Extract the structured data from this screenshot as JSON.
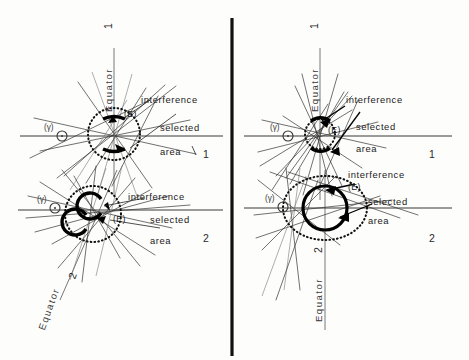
{
  "figure": {
    "background_color": "#fdfdfc",
    "ink_color": "#1a1a1a",
    "panel_count": 4,
    "divider": {
      "name": "vertical-divider",
      "x": 232,
      "y1": 18,
      "y2": 356
    }
  },
  "labels": {
    "equator": "Equator",
    "interference": "interference",
    "selected": "selected",
    "area": "area",
    "center_E": "(E)",
    "gamma": "(γ)",
    "one": "1",
    "two": "2"
  },
  "panels": [
    {
      "id": "top-left",
      "row_number": "1",
      "equator_label": "Equator",
      "equator_number": "1",
      "equator_orientation": "vertical",
      "center": {
        "x": 114,
        "y": 134
      },
      "center_label": "(E)",
      "gamma_label": "(γ)",
      "gamma_point": {
        "x": 62,
        "y": 136
      },
      "dotted_circle_radius": 26,
      "inner_mark": "two-horizontal-arcs",
      "callouts": [
        "interference",
        "selected",
        "area"
      ]
    },
    {
      "id": "bottom-left",
      "row_number": "2",
      "equator_label": "Equator",
      "equator_number": "2",
      "equator_orientation": "tilted",
      "center": {
        "x": 93,
        "y": 214
      },
      "center_label": "(E)",
      "gamma_label": "(γ)",
      "gamma_point": {
        "x": 55,
        "y": 208
      },
      "dotted_circle_radius": 28,
      "inner_mark": "two-c-arcs",
      "callouts": [
        "interference",
        "selected",
        "area"
      ]
    },
    {
      "id": "top-right",
      "row_number": "1",
      "equator_label": "Equator",
      "equator_number": "1",
      "equator_orientation": "vertical",
      "center": {
        "x": 320,
        "y": 134
      },
      "center_label": "(E)",
      "gamma_label": "(γ)",
      "gamma_point": {
        "x": 288,
        "y": 136
      },
      "dotted_circle_radius": 15,
      "inner_mark": "two-vertical-thick-arcs",
      "callouts": [
        "interference",
        "selected",
        "area"
      ]
    },
    {
      "id": "bottom-right",
      "row_number": "2",
      "equator_label": "Equator",
      "equator_number": "2",
      "equator_orientation": "vertical",
      "center": {
        "x": 325,
        "y": 208
      },
      "center_label": "(E)",
      "gamma_label": "(γ)",
      "gamma_point": {
        "x": 283,
        "y": 207
      },
      "dotted_circle_radius": 38,
      "inner_circle_radius": 22,
      "inner_mark": "solid-circle",
      "callouts": [
        "interference",
        "selected",
        "area"
      ]
    }
  ],
  "margin_numbers": [
    {
      "text": "1",
      "x": 431,
      "y": 155
    },
    {
      "text": "2",
      "x": 431,
      "y": 239
    },
    {
      "text": "1",
      "x": 205,
      "y": 155
    },
    {
      "text": "2",
      "x": 205,
      "y": 239
    }
  ]
}
